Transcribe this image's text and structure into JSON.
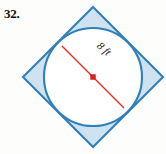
{
  "problem": {
    "number": "32."
  },
  "figure": {
    "name": "circle-inscribed-in-square",
    "diameter_label": "8 ft",
    "colors": {
      "square_stroke": "#2f7fb8",
      "square_fill": "#cfe2ef",
      "circle_stroke": "#2f7fb8",
      "circle_fill": "#ffffff",
      "diameter_line": "#e03127",
      "center_dot": "#d61f1f",
      "background": "#fdfdfb"
    },
    "geometry": {
      "square_center_x": 93,
      "square_center_y": 77,
      "square_half_diagonal": 70,
      "square_rotation_deg": 45,
      "circle_center_x": 93,
      "circle_center_y": 77,
      "circle_radius": 49,
      "diameter_angle_deg": 42,
      "diameter_x1": 62,
      "diameter_y1": 46,
      "diameter_x2": 124,
      "diameter_y2": 108
    }
  },
  "chart_data": {
    "type": "diagram",
    "title": "",
    "shapes": [
      {
        "name": "square",
        "kind": "rotated-square",
        "rotation_deg": 45,
        "center": [
          93,
          77
        ],
        "half_diagonal": 70,
        "fill": "#cfe2ef",
        "stroke": "#2f7fb8"
      },
      {
        "name": "inscribed-circle",
        "kind": "circle",
        "center": [
          93,
          77
        ],
        "radius": 49,
        "fill": "#ffffff",
        "stroke": "#2f7fb8"
      },
      {
        "name": "diameter",
        "kind": "segment",
        "from": [
          62,
          46
        ],
        "to": [
          124,
          108
        ],
        "stroke": "#e03127",
        "label": "8 ft"
      }
    ],
    "annotations": [
      "8 ft",
      "32."
    ]
  }
}
